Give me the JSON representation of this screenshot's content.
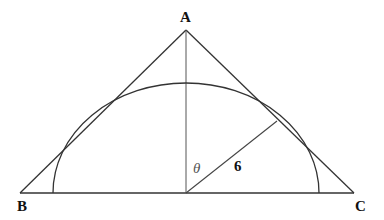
{
  "diagram": {
    "type": "geometry",
    "labels": {
      "vertex_a": "A",
      "vertex_b": "B",
      "vertex_c": "C",
      "angle": "θ",
      "radius_length": "6"
    },
    "colors": {
      "stroke": "#333333",
      "background": "#ffffff"
    }
  }
}
